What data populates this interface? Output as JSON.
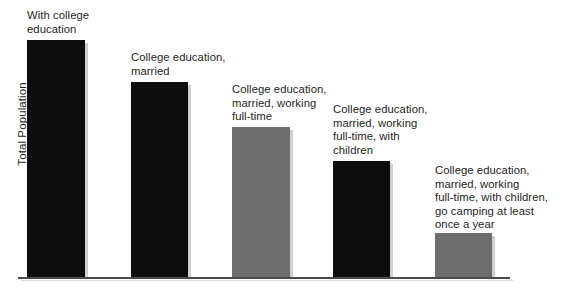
{
  "chart_data": {
    "type": "bar",
    "title": "",
    "xlabel": "",
    "ylabel": "Total Population",
    "grid": false,
    "legend": null,
    "baseline_y_px": 277,
    "axis_max_px": 40,
    "categories": [
      "With college education",
      "College education, married",
      "College education, married, working full-time",
      "College education, married, working full-time, with children",
      "College education, married, working full-time, with children, go camping at least once a year"
    ],
    "values": [
      100,
      82,
      63,
      49,
      19
    ],
    "ylim": [
      0,
      100
    ],
    "value_unit": "relative share of total population",
    "bars": [
      {
        "label_lines": [
          "With college",
          "education"
        ],
        "value": 100,
        "color": "#0d0d0d",
        "x": 27,
        "width": 58,
        "top": 40,
        "label_x": 27,
        "label_y": 9
      },
      {
        "label_lines": [
          "College education,",
          "married"
        ],
        "value": 82,
        "color": "#0d0d0d",
        "x": 131,
        "width": 57,
        "top": 82,
        "label_x": 131,
        "label_y": 51
      },
      {
        "label_lines": [
          "College education,",
          "married, working",
          "full-time"
        ],
        "value": 63,
        "color": "#6e6e6e",
        "x": 232,
        "width": 58,
        "top": 127,
        "label_x": 232,
        "label_y": 83
      },
      {
        "label_lines": [
          "College education,",
          "married, working",
          "full-time, with",
          "children"
        ],
        "value": 49,
        "color": "#0d0d0d",
        "x": 333,
        "width": 57,
        "top": 161,
        "label_x": 333,
        "label_y": 103
      },
      {
        "label_lines": [
          "College education,",
          "married, working",
          "full-time, with children,",
          "go camping at least",
          "once a year"
        ],
        "value": 19,
        "color": "#6e6e6e",
        "x": 435,
        "width": 57,
        "top": 233,
        "label_x": 435,
        "label_y": 164
      }
    ],
    "colors": {
      "bar_dark": "#0d0d0d",
      "bar_gray": "#6e6e6e",
      "axis": "#4a4a4a",
      "text": "#231f20",
      "background": "#ffffff",
      "shadow": "#cfcfcf"
    },
    "axis": {
      "x_start": 18,
      "x_end": 510,
      "y": 277
    }
  }
}
